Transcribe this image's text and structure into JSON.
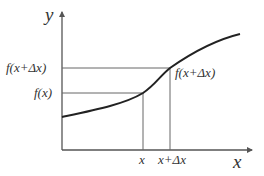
{
  "diagram": {
    "axes": {
      "y_label": "y",
      "x_label": "x"
    },
    "y_ticks": [
      {
        "label": "f(x+Δx)",
        "y": 68
      },
      {
        "label": "f(x)",
        "y": 93
      }
    ],
    "x_ticks": [
      {
        "label": "x",
        "x": 143
      },
      {
        "label": "x+Δx",
        "x": 170
      }
    ],
    "point_label": "f(x+Δx)",
    "curve_points": [
      [
        62,
        117
      ],
      [
        100,
        108
      ],
      [
        130,
        100
      ],
      [
        143,
        93
      ],
      [
        155,
        82
      ],
      [
        170,
        68
      ],
      [
        195,
        53
      ],
      [
        220,
        41
      ],
      [
        240,
        34
      ]
    ],
    "colors": {
      "curve": "#222222",
      "axis": "#555555",
      "guide": "#666666",
      "text": "#333333"
    }
  }
}
